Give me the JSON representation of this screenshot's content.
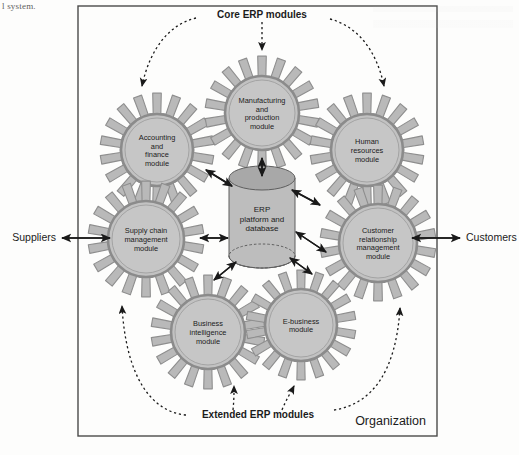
{
  "page": {
    "partial_text_top_left": "l system."
  },
  "diagram": {
    "title_hidden": "",
    "org_boundary_label": "Organization",
    "core_label": "Core ERP modules",
    "extended_label": "Extended ERP modules",
    "external": {
      "left": "Suppliers",
      "right": "Customers"
    },
    "center": {
      "name": "erp-platform-cylinder",
      "lines": [
        "ERP",
        "platform and",
        "database"
      ]
    },
    "core_modules": [
      {
        "id": "accounting-and-finance-module",
        "lines": [
          "Accounting",
          "and",
          "finance",
          "module"
        ],
        "cx": 157,
        "cy": 150,
        "r_outer": 57,
        "r_hub": 32
      },
      {
        "id": "manufacturing-and-production-module",
        "lines": [
          "Manufacturing",
          "and",
          "production",
          "module"
        ],
        "cx": 262,
        "cy": 113,
        "r_outer": 57,
        "r_hub": 33
      },
      {
        "id": "human-resources-module",
        "lines": [
          "Human",
          "resources",
          "module"
        ],
        "cx": 367,
        "cy": 150,
        "r_outer": 57,
        "r_hub": 32
      },
      {
        "id": "supply-chain-management-module",
        "lines": [
          "Supply chain",
          "management",
          "module"
        ],
        "cx": 146,
        "cy": 239,
        "r_outer": 58,
        "r_hub": 34
      },
      {
        "id": "customer-relationship-management-module",
        "lines": [
          "Customer",
          "relationship",
          "management",
          "module"
        ],
        "cx": 378,
        "cy": 243,
        "r_outer": 58,
        "r_hub": 35
      }
    ],
    "extended_modules": [
      {
        "id": "business-intelligence-module",
        "lines": [
          "Business",
          "intelligence",
          "module"
        ],
        "cx": 208,
        "cy": 332,
        "r_outer": 57,
        "r_hub": 33
      },
      {
        "id": "e-business-module",
        "lines": [
          "E-business",
          "module"
        ],
        "cx": 301,
        "cy": 325,
        "r_outer": 55,
        "r_hub": 32
      }
    ],
    "colors": {
      "gear_fill": "#b9b9b9",
      "gear_stroke": "#8e8e8e",
      "hub_fill": "#c2c2c2",
      "hub_stroke": "#8b8b8b",
      "cylinder_fill": "#bdbdbd",
      "cylinder_top": "#a8a8a8",
      "cylinder_bottom": "#8f8f8f",
      "line": "#1a1a1a",
      "frame": "#4a4a4a",
      "text": "#1b1b1b",
      "background": "#fdfdfc"
    },
    "frame": {
      "x": 78,
      "y": 6,
      "width": 359,
      "height": 430
    }
  }
}
